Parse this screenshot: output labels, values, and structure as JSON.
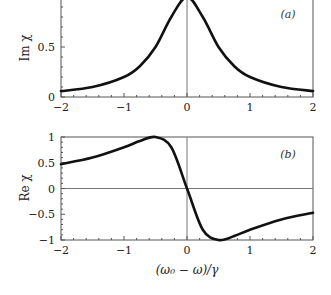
{
  "chart_data": [
    {
      "type": "line",
      "panel_label": "(a)",
      "title": "",
      "xlabel": "",
      "ylabel": "Im χ",
      "xlim": [
        -2,
        2
      ],
      "ylim": [
        0,
        1
      ],
      "x_ticks": [
        "−2",
        "−1",
        "0",
        "1",
        "2"
      ],
      "y_ticks": [
        "0",
        "0.5"
      ],
      "grid": false,
      "reference_lines": {
        "vertical_x": 0
      },
      "series": [
        {
          "name": "Im χ",
          "x": [
            -2,
            -1.5,
            -1,
            -0.75,
            -0.5,
            -0.25,
            0,
            0.25,
            0.5,
            0.75,
            1,
            1.5,
            2
          ],
          "values": [
            0.059,
            0.1,
            0.2,
            0.308,
            0.5,
            0.8,
            1.0,
            0.8,
            0.5,
            0.308,
            0.2,
            0.1,
            0.059
          ]
        }
      ]
    },
    {
      "type": "line",
      "panel_label": "(b)",
      "title": "",
      "xlabel": "(ω₀ − ω)/γ",
      "ylabel": "Re χ",
      "xlim": [
        -2,
        2
      ],
      "ylim": [
        -1,
        1
      ],
      "x_ticks": [
        "−2",
        "−1",
        "0",
        "1",
        "2"
      ],
      "y_ticks": [
        "1",
        "0.5",
        "0",
        "−0.5",
        "−1"
      ],
      "grid": false,
      "reference_lines": {
        "vertical_x": 0,
        "horizontal_y": 0
      },
      "series": [
        {
          "name": "Re χ",
          "x": [
            -2,
            -1.5,
            -1,
            -0.75,
            -0.5,
            -0.25,
            0,
            0.25,
            0.5,
            0.75,
            1,
            1.5,
            2
          ],
          "values": [
            0.471,
            0.6,
            0.8,
            0.923,
            1.0,
            0.8,
            0.0,
            -0.8,
            -1.0,
            -0.923,
            -0.8,
            -0.6,
            -0.471
          ]
        }
      ]
    }
  ],
  "panels": {
    "a": {
      "label": "(a)",
      "ylabel": "Im χ",
      "yticks": [
        "0.5",
        "0"
      ],
      "xticks": [
        "−2",
        "−1",
        "0",
        "1",
        "2"
      ]
    },
    "b": {
      "label": "(b)",
      "ylabel": "Re χ",
      "yticks": [
        "1",
        "0.5",
        "0",
        "−0.5",
        "−1"
      ],
      "xticks": [
        "−2",
        "−1",
        "0",
        "1",
        "2"
      ],
      "xlabel": "(ω₀ − ω)/γ"
    }
  },
  "colors": {
    "curve": "#111111",
    "frame": "#555555",
    "background": "#ffffff"
  }
}
